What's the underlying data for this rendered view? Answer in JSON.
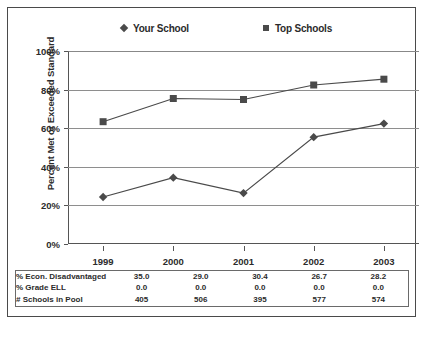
{
  "chart_data": {
    "type": "line",
    "title": "",
    "xlabel": "",
    "ylabel": "Percent Met or Exceeded Standard",
    "categories": [
      "1999",
      "2000",
      "2001",
      "2002",
      "2003"
    ],
    "ylim": [
      0,
      100
    ],
    "ytick_labels": [
      "0%",
      "20%",
      "40%",
      "60%",
      "80%",
      "100%"
    ],
    "ytick_values": [
      0,
      20,
      40,
      60,
      80,
      100
    ],
    "grid": true,
    "legend_position": "top-center",
    "series": [
      {
        "name": "Your School",
        "marker": "diamond",
        "color": "#4a4a4a",
        "values": [
          28,
          38,
          30,
          59,
          66
        ]
      },
      {
        "name": "Top Schools",
        "marker": "square",
        "color": "#4a4a4a",
        "values": [
          67,
          79,
          78.5,
          86,
          89
        ]
      }
    ],
    "table": {
      "row_labels": [
        "% Econ. Disadvantaged",
        "% Grade ELL",
        "# Schools in Pool"
      ],
      "rows": [
        [
          "35.0",
          "29.0",
          "30.4",
          "26.7",
          "28.2"
        ],
        [
          "0.0",
          "0.0",
          "0.0",
          "0.0",
          "0.0"
        ],
        [
          "405",
          "506",
          "395",
          "577",
          "574"
        ]
      ]
    }
  },
  "colors": {
    "frame": "#4a4a4a",
    "gridline": "#8e8e8e",
    "ink": "#2b2b2b",
    "background": "#ffffff"
  }
}
